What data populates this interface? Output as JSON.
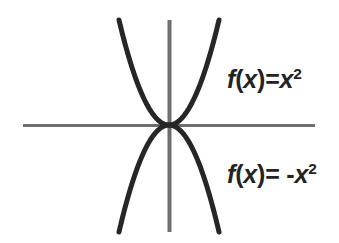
{
  "figure": {
    "background_color": "#ffffff",
    "width": 339,
    "height": 243
  },
  "axes": {
    "color": "#6e6e6e",
    "x_axis": {
      "name": "horizontal-axis",
      "y": 125,
      "x_start": 23,
      "x_end": 315,
      "thickness": 3
    },
    "y_axis": {
      "name": "vertical-axis",
      "x": 169,
      "y_start": 20,
      "y_end": 232,
      "thickness": 4
    },
    "origin": {
      "x": 169,
      "y": 125
    }
  },
  "labels": {
    "upward": {
      "prefix": "f",
      "paren_open": "(",
      "variable": "x",
      "paren_close": ")",
      "equals": "=",
      "sign": "",
      "base": "x",
      "exponent": "2",
      "full_text": "f(x)=x²"
    },
    "downward": {
      "prefix": "f",
      "paren_open": "(",
      "variable": "x",
      "paren_close": ")",
      "equals": "=",
      "sign": " -",
      "base": "x",
      "exponent": "2",
      "full_text": "f(x)= -x²"
    }
  },
  "chart_data": {
    "type": "line",
    "title": "",
    "xlabel": "",
    "ylabel": "",
    "grid": false,
    "legend_position": "inline-annotation",
    "axis_color": "#6e6e6e",
    "curve_color": "#262626",
    "curve_width": 5,
    "xlim": [
      -2.6,
      2.6
    ],
    "ylim": [
      -2.8,
      2.8
    ],
    "origin_px": {
      "x": 169,
      "y": 125
    },
    "px_per_unit_x": 38,
    "px_per_unit_y": 38,
    "series": [
      {
        "name": "f(x)=x²",
        "color": "#262626",
        "equation": "y = x^2",
        "opens": "up",
        "vertex": [
          0,
          0
        ],
        "x": [
          -1.45,
          -1.3,
          -1.15,
          -1.0,
          -0.85,
          -0.7,
          -0.55,
          -0.4,
          -0.25,
          -0.1,
          0,
          0.1,
          0.25,
          0.4,
          0.55,
          0.7,
          0.85,
          1.0,
          1.15,
          1.3,
          1.45
        ],
        "values": [
          2.1,
          1.69,
          1.32,
          1.0,
          0.72,
          0.49,
          0.3,
          0.16,
          0.06,
          0.01,
          0,
          0.01,
          0.06,
          0.16,
          0.3,
          0.49,
          0.72,
          1.0,
          1.32,
          1.69,
          2.1
        ],
        "endpoints_px": [
          [
            114,
            20
          ],
          [
            214,
            20
          ]
        ]
      },
      {
        "name": "f(x)= -x²",
        "color": "#262626",
        "equation": "y = -x^2",
        "opens": "down",
        "vertex": [
          0,
          0
        ],
        "x": [
          -1.4,
          -1.25,
          -1.1,
          -0.95,
          -0.8,
          -0.65,
          -0.5,
          -0.35,
          -0.2,
          -0.05,
          0,
          0.05,
          0.2,
          0.35,
          0.5,
          0.65,
          0.8,
          0.95,
          1.1,
          1.25,
          1.4
        ],
        "values": [
          -1.96,
          -1.56,
          -1.21,
          -0.9,
          -0.64,
          -0.42,
          -0.25,
          -0.12,
          -0.04,
          0.0,
          0,
          0.0,
          -0.04,
          -0.12,
          -0.25,
          -0.42,
          -0.64,
          -0.9,
          -1.21,
          -1.56,
          -1.96
        ],
        "endpoints_px": [
          [
            118,
            232
          ],
          [
            218,
            232
          ]
        ]
      }
    ],
    "annotations": [
      {
        "text": "f(x)=x²",
        "x_px": 227,
        "y_px": 80,
        "series": "f(x)=x²"
      },
      {
        "text": "f(x)= -x²",
        "x_px": 227,
        "y_px": 175,
        "series": "f(x)= -x²"
      }
    ]
  }
}
